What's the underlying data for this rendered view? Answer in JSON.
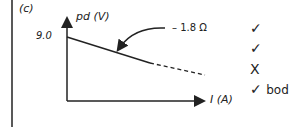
{
  "part_label": "(c)",
  "y_axis_label": "pd (V)",
  "y_intercept_label": "9.0",
  "slope_annotation": "– 1.8 Ω",
  "x_axis_label": "I  (A)",
  "marks": [
    {
      "symbol": "✓",
      "note": ""
    },
    {
      "symbol": "✓",
      "note": ""
    },
    {
      "symbol": "X",
      "note": ""
    },
    {
      "symbol": "✓",
      "note": "bod"
    }
  ],
  "colors": {
    "ink": "#222222",
    "background": "#ffffff"
  }
}
